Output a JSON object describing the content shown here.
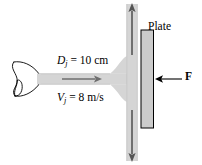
{
  "figure": {
    "background_color": "#ffffff",
    "width": 202,
    "height": 165
  },
  "labels": {
    "jet_diameter": {
      "symbol": "D",
      "subscript": "j",
      "equals": " = 10 cm",
      "full_text": "Dj = 10 cm",
      "value": 10,
      "unit": "cm"
    },
    "jet_velocity": {
      "symbol": "V",
      "subscript": "j",
      "equals": " = 8 m/s",
      "full_text": "Vj = 8 m/s",
      "value": 8,
      "unit": "m/s"
    },
    "plate": "Plate",
    "force": "F"
  },
  "colors": {
    "jet_fill": "#d5d5d5",
    "jet_edge": "#b8b8b8",
    "plate_fill": "#cccccc",
    "plate_stroke": "#000000",
    "nozzle_stroke": "#000000",
    "arrow_dark": "#000000",
    "arrow_gray": "#8f8f8f",
    "text": "#000000"
  },
  "parts": {
    "nozzle": "nozzle",
    "horizontal_jet": "horizontal-jet-stream",
    "vertical_jet_up": "upward-deflected-stream",
    "vertical_jet_down": "downward-deflected-stream",
    "plate": "flat-plate",
    "force_arrow": "force-arrow",
    "flow_arrow_horizontal": "horizontal-flow-arrow",
    "flow_arrow_up": "upward-flow-arrow",
    "flow_arrow_down": "downward-flow-arrow"
  }
}
